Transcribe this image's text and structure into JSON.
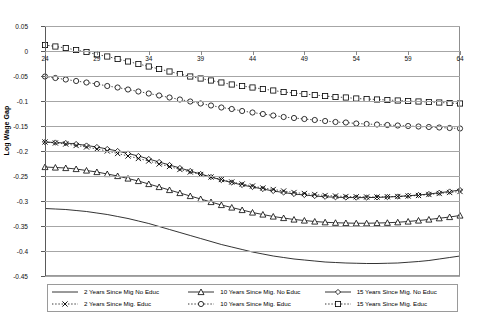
{
  "chart_data": {
    "type": "line",
    "title": "",
    "xlabel": "Age",
    "ylabel": "Log Wage Gap",
    "xlim": [
      24,
      64
    ],
    "ylim": [
      -0.45,
      0.05
    ],
    "ytick_labels": [
      "0.05",
      "0",
      "-0.05",
      "-0.1",
      "-0.15",
      "-0.2",
      "-0.25",
      "-0.3",
      "-0.35",
      "-0.4",
      "-0.45"
    ],
    "ytick_values": [
      0.05,
      0,
      -0.05,
      -0.1,
      -0.15,
      -0.2,
      -0.25,
      -0.3,
      -0.35,
      -0.4,
      -0.45
    ],
    "xtick_labels": [
      "24",
      "29",
      "34",
      "39",
      "44",
      "49",
      "54",
      "59",
      "64"
    ],
    "xtick_values": [
      24,
      29,
      34,
      39,
      44,
      49,
      54,
      59,
      64
    ],
    "grid": true,
    "legend_position": "bottom",
    "x": [
      24,
      25,
      26,
      27,
      28,
      29,
      30,
      31,
      32,
      33,
      34,
      35,
      36,
      37,
      38,
      39,
      40,
      41,
      42,
      43,
      44,
      45,
      46,
      47,
      48,
      49,
      50,
      51,
      52,
      53,
      54,
      55,
      56,
      57,
      58,
      59,
      60,
      61,
      62,
      63,
      64
    ],
    "series": [
      {
        "name": "2 Years Since Mig  No Educ",
        "marker": "none",
        "style": "solid",
        "values": [
          -0.315,
          -0.316,
          -0.317,
          -0.319,
          -0.321,
          -0.324,
          -0.327,
          -0.331,
          -0.335,
          -0.34,
          -0.345,
          -0.351,
          -0.357,
          -0.363,
          -0.369,
          -0.375,
          -0.381,
          -0.387,
          -0.392,
          -0.397,
          -0.402,
          -0.406,
          -0.41,
          -0.413,
          -0.416,
          -0.418,
          -0.42,
          -0.422,
          -0.423,
          -0.424,
          -0.4245,
          -0.425,
          -0.425,
          -0.4245,
          -0.424,
          -0.4225,
          -0.421,
          -0.419,
          -0.416,
          -0.413,
          -0.41
        ]
      },
      {
        "name": "10 Years Since Mig. No Educ",
        "marker": "triangle",
        "style": "solid",
        "values": [
          -0.232,
          -0.233,
          -0.234,
          -0.236,
          -0.239,
          -0.242,
          -0.246,
          -0.25,
          -0.255,
          -0.26,
          -0.266,
          -0.272,
          -0.278,
          -0.284,
          -0.29,
          -0.296,
          -0.302,
          -0.308,
          -0.313,
          -0.318,
          -0.323,
          -0.327,
          -0.331,
          -0.334,
          -0.337,
          -0.339,
          -0.341,
          -0.3425,
          -0.3435,
          -0.344,
          -0.3445,
          -0.3445,
          -0.344,
          -0.3435,
          -0.3425,
          -0.341,
          -0.339,
          -0.337,
          -0.3345,
          -0.332,
          -0.329
        ]
      },
      {
        "name": "15 Years Since Mig. No Educ",
        "marker": "diamond",
        "style": "solid",
        "values": [
          -0.182,
          -0.183,
          -0.184,
          -0.186,
          -0.189,
          -0.192,
          -0.196,
          -0.2,
          -0.205,
          -0.21,
          -0.216,
          -0.222,
          -0.228,
          -0.234,
          -0.24,
          -0.246,
          -0.252,
          -0.258,
          -0.263,
          -0.268,
          -0.272,
          -0.276,
          -0.28,
          -0.283,
          -0.286,
          -0.288,
          -0.29,
          -0.2915,
          -0.2925,
          -0.293,
          -0.2932,
          -0.2932,
          -0.2928,
          -0.292,
          -0.291,
          -0.2895,
          -0.288,
          -0.286,
          -0.2835,
          -0.281,
          -0.278
        ]
      },
      {
        "name": "2 Years Since Mig. Educ",
        "marker": "x",
        "style": "dotted",
        "values": [
          -0.182,
          -0.184,
          -0.186,
          -0.189,
          -0.192,
          -0.196,
          -0.2,
          -0.205,
          -0.21,
          -0.215,
          -0.22,
          -0.226,
          -0.231,
          -0.237,
          -0.242,
          -0.247,
          -0.252,
          -0.257,
          -0.262,
          -0.266,
          -0.27,
          -0.274,
          -0.277,
          -0.28,
          -0.283,
          -0.285,
          -0.287,
          -0.289,
          -0.29,
          -0.291,
          -0.2915,
          -0.292,
          -0.292,
          -0.2915,
          -0.291,
          -0.29,
          -0.289,
          -0.287,
          -0.285,
          -0.283,
          -0.281
        ]
      },
      {
        "name": "10 Years Since Mig. Educ",
        "marker": "circle",
        "style": "dotted",
        "values": [
          -0.051,
          -0.054,
          -0.057,
          -0.06,
          -0.063,
          -0.066,
          -0.07,
          -0.073,
          -0.077,
          -0.081,
          -0.085,
          -0.089,
          -0.093,
          -0.097,
          -0.101,
          -0.105,
          -0.109,
          -0.113,
          -0.116,
          -0.12,
          -0.123,
          -0.126,
          -0.129,
          -0.132,
          -0.134,
          -0.136,
          -0.138,
          -0.14,
          -0.142,
          -0.143,
          -0.145,
          -0.146,
          -0.147,
          -0.148,
          -0.149,
          -0.15,
          -0.151,
          -0.152,
          -0.153,
          -0.154,
          -0.155
        ]
      },
      {
        "name": "15 Years Since Mig. Educ",
        "marker": "square",
        "style": "dotted",
        "values": [
          0.012,
          0.009,
          0.006,
          0.002,
          -0.002,
          -0.007,
          -0.011,
          -0.016,
          -0.021,
          -0.026,
          -0.031,
          -0.036,
          -0.041,
          -0.046,
          -0.051,
          -0.055,
          -0.059,
          -0.063,
          -0.067,
          -0.07,
          -0.073,
          -0.076,
          -0.079,
          -0.082,
          -0.084,
          -0.086,
          -0.088,
          -0.09,
          -0.092,
          -0.093,
          -0.095,
          -0.096,
          -0.097,
          -0.098,
          -0.099,
          -0.1,
          -0.101,
          -0.102,
          -0.103,
          -0.104,
          -0.105
        ]
      }
    ]
  },
  "legend": {
    "items": [
      {
        "label": "2 Years Since Mig  No Educ",
        "marker": "none",
        "style": "solid"
      },
      {
        "label": "10 Years Since Mig. No Educ",
        "marker": "triangle",
        "style": "solid"
      },
      {
        "label": "15 Years Since Mig. No Educ",
        "marker": "diamond",
        "style": "solid"
      },
      {
        "label": "2 Years Since Mig. Educ",
        "marker": "x",
        "style": "dotted"
      },
      {
        "label": "10 Years Since Mig. Educ",
        "marker": "circle",
        "style": "dotted"
      },
      {
        "label": "15 Years Since Mig. Educ",
        "marker": "square",
        "style": "dotted"
      }
    ]
  },
  "colors": {
    "line": "#000000",
    "grid": "#a6a6a6",
    "frame": "#9a9a9a",
    "background": "#ffffff"
  }
}
